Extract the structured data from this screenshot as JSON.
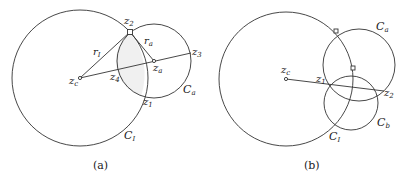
{
  "panels": [
    {
      "caption": "(a)",
      "labels": {
        "z2": {
          "base": "z",
          "sub": "2"
        },
        "rI": {
          "base": "r",
          "sub": "I"
        },
        "ra": {
          "base": "r",
          "sub": "a"
        },
        "z3": {
          "base": "z",
          "sub": "3"
        },
        "zc": {
          "base": "z",
          "sub": "c"
        },
        "z4": {
          "base": "z",
          "sub": "4"
        },
        "za": {
          "base": "z",
          "sub": "a"
        },
        "Ca": {
          "base": "C",
          "sub": "a"
        },
        "z1": {
          "base": "z",
          "sub": "1"
        },
        "CI": {
          "base": "C",
          "sub": "I"
        }
      }
    },
    {
      "caption": "(b)",
      "labels": {
        "Ca": {
          "base": "C",
          "sub": "a"
        },
        "zc": {
          "base": "z",
          "sub": "c"
        },
        "z1": {
          "base": "z",
          "sub": "1"
        },
        "z2": {
          "base": "z",
          "sub": "2"
        },
        "CI": {
          "base": "C",
          "sub": "I"
        },
        "Cb": {
          "base": "C",
          "sub": "b"
        }
      }
    }
  ],
  "colors": {
    "stroke": "#333333",
    "shade": "#eeeeee"
  }
}
